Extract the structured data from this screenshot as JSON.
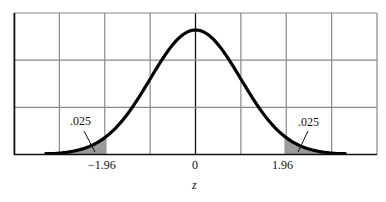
{
  "chart_data": {
    "type": "line",
    "title": "",
    "xlabel": "z",
    "ylabel": "",
    "xlim": [
      -4,
      4
    ],
    "ylim": [
      0,
      0.45
    ],
    "grid": true,
    "grid_columns": 8,
    "grid_rows": 3,
    "series": [
      {
        "name": "Standard normal density",
        "function": "N(0,1) pdf",
        "color": "#000000"
      }
    ],
    "x_tick_labels": [
      {
        "value": -1.96,
        "label": "−1.96"
      },
      {
        "value": 0,
        "label": "0"
      },
      {
        "value": 1.96,
        "label": "1.96"
      }
    ],
    "shaded_regions": [
      {
        "from": -4,
        "to": -1.96,
        "area": 0.025,
        "label": ".025"
      },
      {
        "from": 1.96,
        "to": 4,
        "area": 0.025,
        "label": ".025"
      }
    ],
    "annotations": [
      ".025",
      ".025"
    ]
  },
  "labels": {
    "left_tail": ".025",
    "right_tail": ".025",
    "tick_neg": "−1.96",
    "tick_zero": "0",
    "tick_pos": "1.96",
    "x_axis": "z"
  },
  "colors": {
    "grid": "#8a8a8a",
    "curve": "#000000",
    "shade": "#9a9a9a"
  }
}
